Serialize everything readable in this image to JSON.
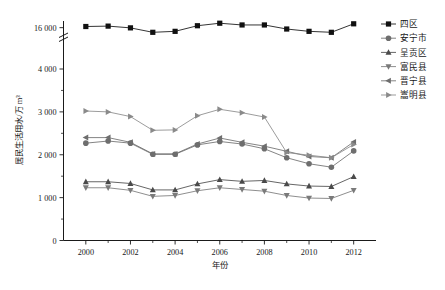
{
  "chart_data": {
    "type": "line",
    "title": "",
    "xlabel": "年份",
    "ylabel": "居民生活用水/万 m³",
    "x": [
      2000,
      2001,
      2002,
      2003,
      2004,
      2005,
      2006,
      2007,
      2008,
      2009,
      2010,
      2011,
      2012
    ],
    "xlim": [
      1999,
      2013
    ],
    "ylim": [
      0,
      16500
    ],
    "y_ticks": [
      "0",
      "1 000",
      "2 000",
      "3 000",
      "4 000",
      "16 000"
    ],
    "y_tick_values": [
      0,
      1000,
      2000,
      3000,
      4000,
      16000
    ],
    "axis_break": true,
    "axis_break_note": "y-axis broken between 4 000 and 16 000",
    "x_ticks": [
      "2000",
      "2002",
      "2004",
      "2006",
      "2008",
      "2010",
      "2012"
    ],
    "grid": false,
    "legend_position": "right",
    "series": [
      {
        "name": "四区",
        "marker": "square",
        "color": "#111111",
        "values": [
          16060,
          16080,
          15990,
          15760,
          15810,
          16100,
          16230,
          16140,
          16140,
          15930,
          15810,
          15760,
          16200
        ]
      },
      {
        "name": "安宁市",
        "marker": "circle",
        "color": "#6e6e6e",
        "values": [
          2270,
          2320,
          2270,
          2010,
          2010,
          2230,
          2310,
          2250,
          2140,
          1930,
          1790,
          1710,
          2090
        ]
      },
      {
        "name": "呈贡区",
        "marker": "triangle-up",
        "color": "#4a4a4a",
        "values": [
          1370,
          1370,
          1330,
          1180,
          1180,
          1320,
          1420,
          1380,
          1400,
          1320,
          1270,
          1260,
          1490
        ]
      },
      {
        "name": "富民县",
        "marker": "triangle-down",
        "color": "#7a7a7a",
        "values": [
          1230,
          1230,
          1170,
          1030,
          1050,
          1160,
          1230,
          1190,
          1150,
          1050,
          990,
          980,
          1170
        ]
      },
      {
        "name": "晋宁县",
        "marker": "triangle-left",
        "color": "#6e6e6e",
        "values": [
          2400,
          2400,
          2290,
          2020,
          2020,
          2250,
          2390,
          2290,
          2200,
          2080,
          1960,
          1930,
          2300
        ]
      },
      {
        "name": "嵩明县",
        "marker": "triangle-right",
        "color": "#8a8a8a",
        "values": [
          3020,
          3000,
          2890,
          2570,
          2580,
          2910,
          3060,
          2980,
          2880,
          2050,
          1990,
          1930,
          2240
        ]
      }
    ]
  },
  "legend": {
    "items": [
      {
        "label": "四区"
      },
      {
        "label": "安宁市"
      },
      {
        "label": "呈贡区"
      },
      {
        "label": "富民县"
      },
      {
        "label": "晋宁县"
      },
      {
        "label": "嵩明县"
      }
    ]
  },
  "axes": {
    "y_label": "居民生活用水/万 m³",
    "x_label": "年份"
  }
}
